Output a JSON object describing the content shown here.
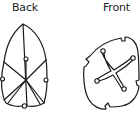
{
  "labels": {
    "back": "Back",
    "front": "Front"
  },
  "figures": [
    {
      "name": "back-view",
      "label": "Back",
      "shape": "pointed-shield-with-folded-panels"
    },
    {
      "name": "front-view",
      "label": "Front",
      "shape": "rounded-square-with-cross-star"
    }
  ],
  "colors": {
    "line": "#1a1a1a",
    "background": "#ffffff"
  }
}
